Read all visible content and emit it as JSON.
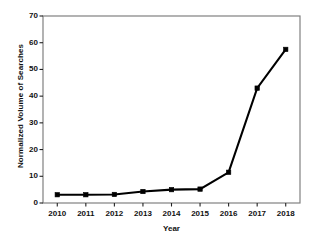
{
  "chart_data": {
    "type": "line",
    "title": "",
    "xlabel": "Year",
    "ylabel": "Normalized Volume of Searches",
    "categories": [
      "2010",
      "2011",
      "2012",
      "2013",
      "2014",
      "2015",
      "2016",
      "2017",
      "2018"
    ],
    "x": [
      2010,
      2011,
      2012,
      2013,
      2014,
      2015,
      2016,
      2017,
      2018
    ],
    "values": [
      3.1,
      3.1,
      3.2,
      4.3,
      5.0,
      5.2,
      11.5,
      43.0,
      57.5
    ],
    "series": [
      {
        "name": "Normalized Volume of Searches",
        "values": [
          3.1,
          3.1,
          3.2,
          4.3,
          5.0,
          5.2,
          11.5,
          43.0,
          57.5
        ]
      }
    ],
    "xlim": [
      2009.5,
      2018.5
    ],
    "ylim": [
      0,
      70
    ],
    "yticks": [
      0,
      10,
      20,
      30,
      40,
      50,
      60,
      70
    ],
    "ytick_labels": [
      "0",
      "10",
      "20",
      "30",
      "40",
      "50",
      "60",
      "70"
    ],
    "xticks": [
      2010,
      2011,
      2012,
      2013,
      2014,
      2015,
      2016,
      2017,
      2018
    ],
    "xtick_labels": [
      "2010",
      "2011",
      "2012",
      "2013",
      "2014",
      "2015",
      "2016",
      "2017",
      "2018"
    ],
    "grid": false,
    "legend": false,
    "legend_position": "none",
    "marker": "square",
    "line_color": "#000000",
    "marker_color": "#000000",
    "frame_color": "#808080",
    "background_color": "#ffffff"
  }
}
